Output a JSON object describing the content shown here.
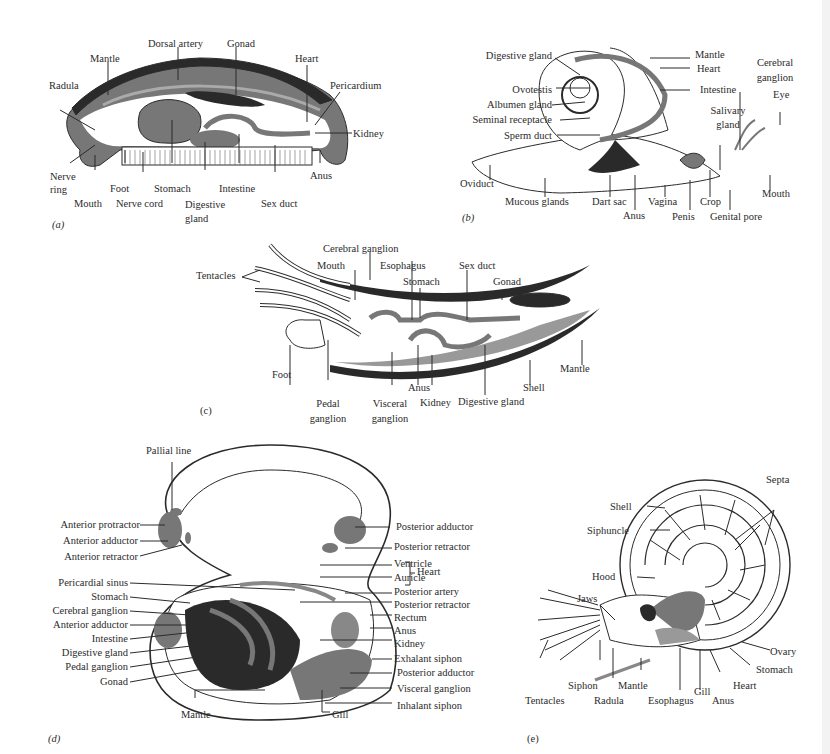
{
  "colors": {
    "ink": "#2b2b2b",
    "gray_fill": "#777777",
    "dark_fill": "#2a2a2a",
    "background": "#ffffff"
  },
  "panels": {
    "a": {
      "tag": "(a)",
      "labels": [
        "Mantle",
        "Dorsal artery",
        "Gonad",
        "Heart",
        "Radula",
        "Pericardium",
        "Kidney",
        "Nerve ring",
        "Mouth",
        "Foot",
        "Nerve cord",
        "Stomach",
        "Digestive gland",
        "Intestine",
        "Sex duct",
        "Anus"
      ]
    },
    "b": {
      "tag": "(b)",
      "labels": [
        "Digestive gland",
        "Ovotestis",
        "Albumen gland",
        "Seminal receptacle",
        "Sperm duct",
        "Oviduct",
        "Mucous glands",
        "Dart sac",
        "Anus",
        "Vagina",
        "Penis",
        "Crop",
        "Genital pore",
        "Mouth",
        "Eye",
        "Cerebral ganglion",
        "Salivary gland",
        "Intestine",
        "Heart",
        "Mantle"
      ]
    },
    "c": {
      "tag": "(c)",
      "labels": [
        "Tentacles",
        "Cerebral ganglion",
        "Mouth",
        "Esophagus",
        "Stomach",
        "Sex duct",
        "Gonad",
        "Foot",
        "Pedal ganglion",
        "Visceral ganglion",
        "Anus",
        "Kidney",
        "Digestive gland",
        "Shell",
        "Mantle"
      ]
    },
    "d": {
      "tag": "(d)",
      "labels_left": [
        "Pallial line",
        "Anterior protractor",
        "Anterior adductor",
        "Anterior retractor",
        "Pericardial sinus",
        "Stomach",
        "Cerebral ganglion",
        "Anterior adductor",
        "Intestine",
        "Digestive gland",
        "Pedal ganglion",
        "Gonad",
        "Mantle"
      ],
      "labels_right": [
        "Posterior adductor",
        "Posterior retractor",
        "Ventricle",
        "Auricle",
        "Heart",
        "Posterior artery",
        "Posterior retractor",
        "Rectum",
        "Anus",
        "Kidney",
        "Exhalant siphon",
        "Posterior adductor",
        "Visceral ganglion",
        "Inhalant siphon",
        "Gill"
      ]
    },
    "e": {
      "tag": "(e)",
      "labels": [
        "Septa",
        "Shell",
        "Siphuncle",
        "Hood",
        "Jaws",
        "Tentacles",
        "Siphon",
        "Radula",
        "Mantle",
        "Esophagus",
        "Gill",
        "Anus",
        "Heart",
        "Stomach",
        "Ovary"
      ]
    }
  }
}
